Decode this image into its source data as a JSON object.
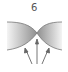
{
  "figure": {
    "number_label": "6",
    "shape": "pinch-point",
    "arrow_count": 3,
    "colors": {
      "fill_dark": "#9a9a9a",
      "fill_light": "#f2f2f2",
      "stroke": "#777777",
      "arrow": "#666666"
    }
  }
}
